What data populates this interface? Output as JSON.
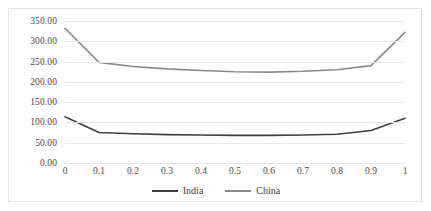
{
  "chart_data": {
    "type": "line",
    "title": "",
    "xlabel": "",
    "ylabel": "",
    "grid": true,
    "legend_position": "bottom",
    "x": [
      0,
      0.1,
      0.2,
      0.3,
      0.4,
      0.5,
      0.6,
      0.7,
      0.8,
      0.9,
      1
    ],
    "x_tick_labels": [
      "0",
      "0.1",
      "0.2",
      "0.3",
      "0.4",
      "0.5",
      "0.6",
      "0.7",
      "0.8",
      "0.9",
      "1"
    ],
    "xlim": [
      0,
      1
    ],
    "ylim": [
      0,
      350
    ],
    "y_tick_labels": [
      "0.00",
      "50.00",
      "100.00",
      "150.00",
      "200.00",
      "250.00",
      "300.00",
      "350.00"
    ],
    "y_ticks": [
      0,
      50,
      100,
      150,
      200,
      250,
      300,
      350
    ],
    "series": [
      {
        "name": "India",
        "color": "#3f3f3f",
        "values": [
          114,
          75,
          72,
          70,
          69,
          68,
          68,
          69,
          71,
          80,
          110
        ]
      },
      {
        "name": "China",
        "color": "#8a8a8a",
        "values": [
          332,
          248,
          238,
          232,
          228,
          225,
          224,
          226,
          230,
          240,
          322
        ]
      }
    ],
    "legend": [
      {
        "label": "India",
        "color": "#3f3f3f"
      },
      {
        "label": "China",
        "color": "#8a8a8a"
      }
    ]
  },
  "colors": {
    "india": "#3f3f3f",
    "china": "#8a8a8a",
    "gridline": "#e8e8e8",
    "border": "#e3e3e3",
    "background": "#ffffff",
    "tick_text": "#4a4a4a"
  }
}
